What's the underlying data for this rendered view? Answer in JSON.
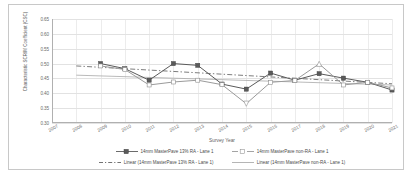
{
  "chart_data": {
    "type": "line",
    "title": "",
    "xlabel": "Survey Year",
    "ylabel": "Characteristic SCRIM Coefficient (CSC)",
    "x": [
      2007,
      2008,
      2009,
      2010,
      2011,
      2012,
      2013,
      2014,
      2015,
      2016,
      2017,
      2018,
      2019,
      2020,
      2021
    ],
    "xlim": [
      2007,
      2021
    ],
    "ylim": [
      0.3,
      0.65
    ],
    "yticks": [
      "0.30",
      "0.35",
      "0.40",
      "0.45",
      "0.50",
      "0.55",
      "0.60",
      "0.65"
    ],
    "ytick_values": [
      0.3,
      0.35,
      0.4,
      0.45,
      0.5,
      0.55,
      0.6,
      0.65
    ],
    "xticks": [
      "2007",
      "2008",
      "2009",
      "2010",
      "2011",
      "2012",
      "2013",
      "2014",
      "2015",
      "2016",
      "2017",
      "2018",
      "2019",
      "2020",
      "2021"
    ],
    "grid": true,
    "legend_position": "bottom",
    "series": [
      {
        "name": "14mm MasterPave 13% RA - Lane 1",
        "marker": "filled-square",
        "line_style": "solid",
        "color": "#5a5a5a",
        "x": [
          2009,
          2010,
          2011,
          2012,
          2013,
          2014,
          2015,
          2016,
          2017,
          2018,
          2019,
          2020,
          2021
        ],
        "values": [
          0.5,
          0.483,
          0.444,
          0.5,
          0.494,
          0.431,
          0.414,
          0.468,
          0.444,
          0.466,
          0.451,
          0.437,
          0.411
        ]
      },
      {
        "name": "14mm MasterPave non-RA - Lane 1",
        "marker": "open-square",
        "line_style": "solid",
        "color": "#9a9a9a",
        "x": [
          2009,
          2010,
          2011,
          2012,
          2013,
          2014,
          2015,
          2016,
          2017,
          2018,
          2019,
          2020,
          2021
        ],
        "values": [
          0.492,
          0.48,
          0.428,
          0.438,
          0.444,
          0.429,
          0.365,
          0.437,
          0.443,
          0.499,
          0.428,
          0.437,
          0.418
        ]
      },
      {
        "name": "Linear (14mm MasterPave 13% RA - Lane 1)",
        "trendline": true,
        "line_style": "dashed",
        "color": "#5a5a5a",
        "endpoints": [
          [
            2008,
            0.492
          ],
          [
            2021,
            0.432
          ]
        ]
      },
      {
        "name": "Linear (14mm MasterPave non-RA - Lane 1)",
        "trendline": true,
        "line_style": "solid",
        "color": "#a8a8a8",
        "endpoints": [
          [
            2008,
            0.461
          ],
          [
            2021,
            0.428
          ]
        ]
      }
    ]
  },
  "legend": {
    "entries": [
      {
        "label": "14mm MasterPave 13% RA - Lane 1"
      },
      {
        "label": "14mm MasterPave non-RA - Lane 1"
      },
      {
        "label": "Linear (14mm MasterPave 13% RA - Lane 1)"
      },
      {
        "label": "Linear (14mm MasterPave non-RA - Lane 1)"
      }
    ]
  }
}
